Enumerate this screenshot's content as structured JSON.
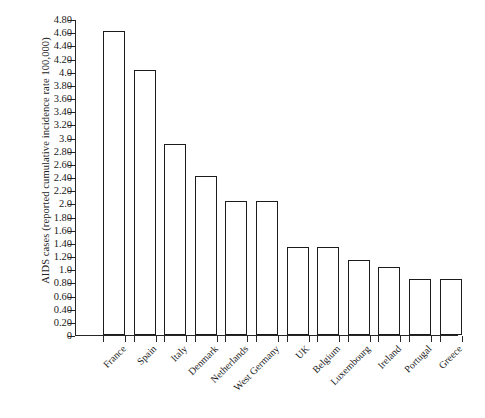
{
  "chart_data": {
    "type": "bar",
    "title": "",
    "xlabel": "",
    "ylabel": "AIDS cases (reported cumulative incidence rate 100,000)",
    "ylim": [
      0,
      4.8
    ],
    "grid": false,
    "legend": false,
    "orientation": "vertical",
    "bar_style": "hollow-outline",
    "categories": [
      "France",
      "Spain",
      "Italy",
      "Denmark",
      "Netherlands",
      "West Germany",
      "UK",
      "Belgium",
      "Luxembourg",
      "Ireland",
      "Portugal",
      "Greece"
    ],
    "values": [
      4.62,
      4.03,
      2.9,
      2.42,
      2.03,
      2.03,
      1.33,
      1.33,
      1.14,
      1.04,
      0.85,
      0.85
    ],
    "ytick_labels": [
      "0",
      "0.20",
      "0.40",
      "0.60",
      "0.80",
      "1.0",
      "1.20",
      "1.40",
      "1.60",
      "1.80",
      "2.0",
      "2.20",
      "2.40",
      "2.60",
      "2.80",
      "3.0",
      "3.20",
      "3.40",
      "3.60",
      "3.80",
      "4.0",
      "4.20",
      "4.40",
      "4.60",
      "4.80"
    ],
    "ytick_values": [
      0,
      0.2,
      0.4,
      0.6,
      0.8,
      1.0,
      1.2,
      1.4,
      1.6,
      1.8,
      2.0,
      2.2,
      2.4,
      2.6,
      2.8,
      3.0,
      3.2,
      3.4,
      3.6,
      3.8,
      4.0,
      4.2,
      4.4,
      4.6,
      4.8
    ],
    "colors": {
      "bar_fill": "#ffffff",
      "bar_outline": "#1c1c1c",
      "axis": "#262626",
      "text": "#1a1a1a",
      "background": "#ffffff"
    }
  }
}
